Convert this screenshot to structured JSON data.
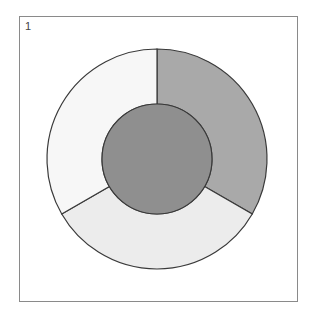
{
  "panel": {
    "label": "1",
    "frame_color": "#8a8a8a"
  },
  "diagram": {
    "type": "donut-with-center-circle",
    "center": [
      157,
      159
    ],
    "outer_radius": 110,
    "inner_radius": 55,
    "stroke_color": "#3a3a3a",
    "center_circle_color": "#8f8f8f",
    "segments": [
      {
        "name": "right",
        "start_angle": -90,
        "end_angle": 30,
        "color": "#a9a9a9"
      },
      {
        "name": "bottom",
        "start_angle": 30,
        "end_angle": 150,
        "color": "#ececec"
      },
      {
        "name": "left",
        "start_angle": 150,
        "end_angle": 270,
        "color": "#f7f7f7"
      }
    ]
  }
}
